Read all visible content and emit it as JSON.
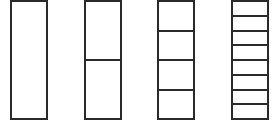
{
  "diagram": {
    "title": "",
    "stroke_color": "#2a2a2a",
    "background": "#ffffff",
    "bars": [
      {
        "name": "whole",
        "parts": 1,
        "left": 10,
        "width": 38
      },
      {
        "name": "halves",
        "parts": 2,
        "left": 84,
        "width": 38
      },
      {
        "name": "quarters",
        "parts": 4,
        "left": 157,
        "width": 38
      },
      {
        "name": "eighths",
        "parts": 8,
        "left": 231,
        "width": 38
      }
    ]
  }
}
